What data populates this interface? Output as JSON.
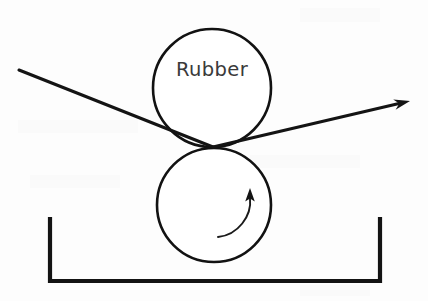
{
  "figure": {
    "background_color": "#fdfdfd",
    "ink_color": "#141414",
    "label_color": "#3a3a3a"
  },
  "labels": {
    "upper_roller": "Rubber"
  },
  "geometry": {
    "canvas": {
      "width": 428,
      "height": 301
    },
    "upper_roller": {
      "cx": 212,
      "cy": 88,
      "r": 59
    },
    "lower_roller": {
      "cx": 214,
      "cy": 205,
      "r": 57
    },
    "nip_point": {
      "x": 213,
      "y": 147
    },
    "incoming_web": {
      "x1": 19,
      "y1": 70,
      "x2": 213,
      "y2": 147
    },
    "outgoing_web": {
      "x1": 213,
      "y1": 147,
      "x2": 410,
      "y2": 101
    },
    "trough": {
      "left_x": 50,
      "right_x": 380,
      "top_y": 217,
      "bottom_y": 281
    },
    "rotation_arrow": {
      "start_x": 218,
      "start_y": 237,
      "end_x": 250,
      "end_y": 192
    }
  },
  "elements": {
    "upper_roller_name": "upper-rubber-roller",
    "lower_roller_name": "lower-applicator-roller",
    "trough_name": "coating-trough",
    "incoming_name": "incoming-web-line",
    "outgoing_name": "outgoing-web-arrow",
    "rotation_name": "rotation-direction-arrow"
  }
}
